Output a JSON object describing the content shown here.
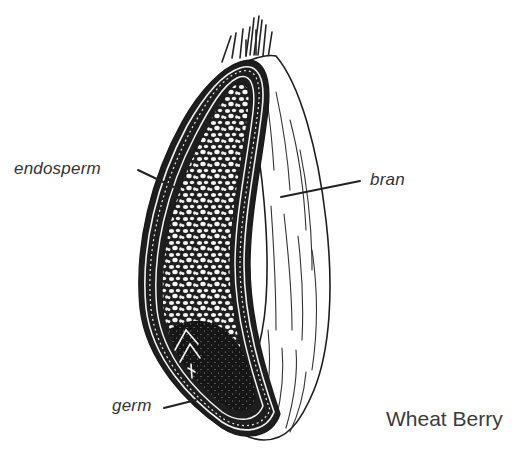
{
  "figure": {
    "caption": "Wheat Berry",
    "labels": {
      "endosperm": "endosperm",
      "bran": "bran",
      "germ": "germ"
    },
    "parts": [
      {
        "name": "endosperm",
        "description": "starchy inner body, cellular speckled texture"
      },
      {
        "name": "bran",
        "description": "outer striated hull"
      },
      {
        "name": "germ",
        "description": "dark embryo at base"
      },
      {
        "name": "brush",
        "description": "hair-like bristles at tip"
      }
    ],
    "colors": {
      "ink": "#1e1e1e",
      "paper": "#ffffff",
      "label_text": "#333333"
    }
  }
}
